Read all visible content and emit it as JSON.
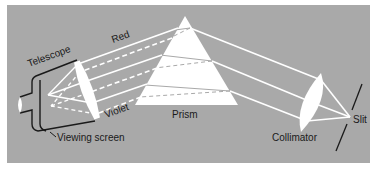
{
  "diagram": {
    "colors": {
      "panel": "#a9a9a9",
      "background": "#ffffff",
      "light": "#ffffff",
      "outline": "#1a1a1a"
    },
    "labels": {
      "red": "Red",
      "violet": "Violet",
      "telescope": "Telescope",
      "viewing_screen": "Viewing screen",
      "prism": "Prism",
      "collimator": "Collimator",
      "slit": "Slit"
    },
    "components": [
      {
        "id": "slit",
        "label": "Slit"
      },
      {
        "id": "collimator",
        "label": "Collimator",
        "type": "lens"
      },
      {
        "id": "prism",
        "label": "Prism",
        "type": "triangle"
      },
      {
        "id": "telescope",
        "label": "Telescope",
        "type": "lens + tube"
      },
      {
        "id": "viewing-screen",
        "label": "Viewing screen"
      }
    ],
    "rays": {
      "red": {
        "style": "solid",
        "label": "Red"
      },
      "violet": {
        "style": "dashed",
        "label": "Violet"
      }
    }
  }
}
